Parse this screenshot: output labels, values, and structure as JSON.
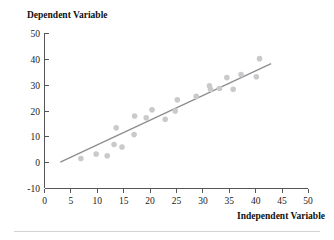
{
  "chart_data": {
    "type": "scatter",
    "title": "",
    "xlabel": "Independent Variable",
    "ylabel": "Dependent Variable",
    "xlim": [
      0,
      50
    ],
    "ylim": [
      -10,
      50
    ],
    "xticks": [
      0,
      5,
      10,
      15,
      20,
      25,
      30,
      35,
      40,
      45,
      50
    ],
    "yticks": [
      -10,
      0,
      10,
      20,
      30,
      40,
      50
    ],
    "xtick_labels": [
      "0",
      "5",
      "10",
      "15",
      "20",
      "25",
      "30",
      "35",
      "40",
      "45",
      "50"
    ],
    "ytick_labels": [
      "-10",
      "0",
      "10",
      "20",
      "30",
      "40",
      "50"
    ],
    "grid": false,
    "legend": false,
    "series": [
      {
        "name": "observations",
        "marker": "circle",
        "color": "#c9cacc",
        "points": [
          {
            "x": 6.9,
            "y": 1.6
          },
          {
            "x": 9.8,
            "y": 3.3
          },
          {
            "x": 11.9,
            "y": 2.6
          },
          {
            "x": 13.2,
            "y": 7.0
          },
          {
            "x": 13.6,
            "y": 13.4
          },
          {
            "x": 14.7,
            "y": 6.0
          },
          {
            "x": 17.0,
            "y": 10.8
          },
          {
            "x": 17.1,
            "y": 18.0
          },
          {
            "x": 19.3,
            "y": 17.3
          },
          {
            "x": 20.4,
            "y": 20.4
          },
          {
            "x": 22.9,
            "y": 16.7
          },
          {
            "x": 24.8,
            "y": 19.9
          },
          {
            "x": 25.2,
            "y": 24.2
          },
          {
            "x": 28.8,
            "y": 25.6
          },
          {
            "x": 31.3,
            "y": 29.6
          },
          {
            "x": 31.5,
            "y": 28.3
          },
          {
            "x": 33.2,
            "y": 28.6
          },
          {
            "x": 34.6,
            "y": 32.8
          },
          {
            "x": 35.8,
            "y": 28.3
          },
          {
            "x": 37.3,
            "y": 34.0
          },
          {
            "x": 40.2,
            "y": 33.1
          },
          {
            "x": 40.8,
            "y": 40.1
          }
        ]
      }
    ],
    "trend_line": {
      "name": "fitted-regression-line",
      "color": "#8c8d90",
      "x_start": 3.0,
      "y_start": 0.2,
      "x_end": 43.0,
      "y_end": 38.2
    }
  }
}
